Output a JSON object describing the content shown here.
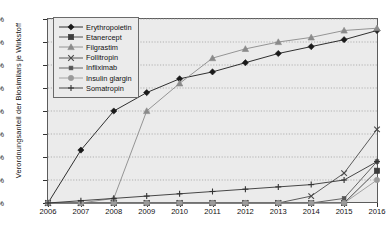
{
  "chart_data": {
    "type": "line",
    "title": "",
    "xlabel": "",
    "ylabel": "Verordnungsanteil der Biosimilars je Wirkstoff",
    "x": [
      2006,
      2007,
      2008,
      2009,
      2010,
      2011,
      2012,
      2013,
      2014,
      2015,
      2016
    ],
    "xtick_labels": [
      "2006",
      "2007",
      "2008",
      "2009",
      "2010",
      "2011",
      "2012",
      "2013",
      "2014",
      "2015",
      "2016"
    ],
    "ytick_labels": [
      "0%",
      "10%",
      "20%",
      "30%",
      "40%",
      "50%",
      "60%",
      "70%",
      "80%"
    ],
    "ytick_values": [
      0,
      10,
      20,
      30,
      40,
      50,
      60,
      70,
      80
    ],
    "ylim": [
      0,
      80
    ],
    "xlim": [
      2006,
      2016
    ],
    "grid": true,
    "legend_position": "top-left",
    "series": [
      {
        "name": "Erythropoietin",
        "marker": "diamond",
        "color": "#1a1a1a",
        "values": [
          0,
          23,
          40,
          48,
          54,
          57,
          61,
          65,
          68,
          71,
          75
        ]
      },
      {
        "name": "Etanercept",
        "marker": "square",
        "color": "#3d3d3d",
        "values": [
          0,
          0,
          0,
          0,
          0,
          0,
          0,
          0,
          0,
          0,
          14
        ]
      },
      {
        "name": "Filgrastim",
        "marker": "triangle",
        "color": "#8a8a8a",
        "values": [
          0,
          0,
          2,
          40,
          52,
          63,
          67,
          70,
          72,
          75,
          76
        ]
      },
      {
        "name": "Follitropin",
        "marker": "x",
        "color": "#4a4a4a",
        "values": [
          0,
          0,
          0,
          0,
          0,
          0,
          0,
          0,
          3,
          13,
          32
        ]
      },
      {
        "name": "Infliximab",
        "marker": "square-small",
        "color": "#555555",
        "values": [
          0,
          0,
          0,
          0,
          0,
          0,
          0,
          0,
          0,
          2,
          18
        ]
      },
      {
        "name": "Insulin glargin",
        "marker": "circle",
        "color": "#9a9a9a",
        "values": [
          0,
          0,
          0,
          0,
          0,
          0,
          0,
          0,
          0,
          0,
          10
        ]
      },
      {
        "name": "Somatropin",
        "marker": "plus",
        "color": "#333333",
        "values": [
          0,
          1,
          2,
          3,
          4,
          5,
          6,
          7,
          8,
          10,
          18
        ]
      }
    ]
  },
  "legend": {
    "items": [
      {
        "label": "Erythropoietin"
      },
      {
        "label": "Etanercept"
      },
      {
        "label": "Filgrastim"
      },
      {
        "label": "Follitropin"
      },
      {
        "label": "Infliximab"
      },
      {
        "label": "Insulin glargin"
      },
      {
        "label": "Somatropin"
      }
    ]
  }
}
